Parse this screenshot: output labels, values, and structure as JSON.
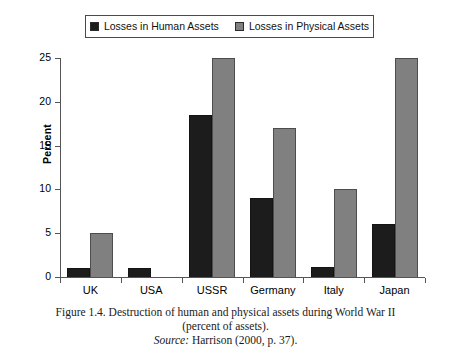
{
  "legend": {
    "entries": [
      {
        "label": "Losses in Human Assets",
        "color": "#1c1c1c",
        "key": "human"
      },
      {
        "label": "Losses in Physical Assets",
        "color": "#808080",
        "key": "physical"
      }
    ]
  },
  "axes": {
    "ylabel": "Percent",
    "yticks": [
      "0",
      "5",
      "10",
      "15",
      "20",
      "25"
    ]
  },
  "caption": {
    "line1": "Figure 1.4.  Destruction of human and physical assets during World War II",
    "line2": "(percent of assets).",
    "source_word": "Source:",
    "source_text": " Harrison (2000, p. 37)."
  },
  "chart_data": {
    "type": "bar",
    "title": "Destruction of human and physical assets during World War II (percent of assets)",
    "xlabel": "",
    "ylabel": "Percent",
    "ylim": [
      0,
      25
    ],
    "yticks": [
      0,
      5,
      10,
      15,
      20,
      25
    ],
    "grid": false,
    "legend_position": "top-center",
    "categories": [
      "UK",
      "USA",
      "USSR",
      "Germany",
      "Italy",
      "Japan"
    ],
    "series": [
      {
        "name": "Losses in Human Assets",
        "color": "#1c1c1c",
        "values": [
          1,
          1,
          18.5,
          9,
          1.2,
          6
        ]
      },
      {
        "name": "Losses in Physical Assets",
        "color": "#808080",
        "values": [
          5,
          0,
          25,
          17,
          10,
          25
        ]
      }
    ],
    "source": "Harrison (2000, p. 37)."
  }
}
